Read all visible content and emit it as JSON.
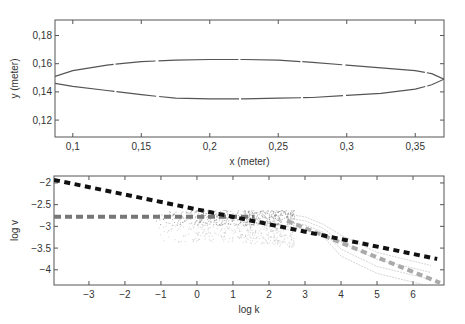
{
  "chart_data": [
    {
      "type": "line",
      "title": "",
      "xlabel": "x (meter)",
      "ylabel": "y (meter)",
      "xlim": [
        0.087,
        0.371
      ],
      "ylim": [
        0.108,
        0.191
      ],
      "xticks": [
        0.1,
        0.15,
        0.2,
        0.25,
        0.3,
        0.35
      ],
      "xtick_labels": [
        "0,1",
        "0,15",
        "0,2",
        "0,25",
        "0,3",
        "0,35"
      ],
      "yticks": [
        0.12,
        0.14,
        0.16,
        0.18
      ],
      "ytick_labels": [
        "0,12",
        "0,14",
        "0,16",
        "0,18"
      ],
      "grid": false,
      "legend": null,
      "series": [
        {
          "name": "upper contour",
          "color": "#555555",
          "x": [
            0.087,
            0.1,
            0.125,
            0.15,
            0.175,
            0.2,
            0.225,
            0.25,
            0.275,
            0.3,
            0.325,
            0.35,
            0.362,
            0.371
          ],
          "y": [
            0.151,
            0.155,
            0.159,
            0.1615,
            0.1625,
            0.163,
            0.163,
            0.1625,
            0.161,
            0.159,
            0.157,
            0.155,
            0.153,
            0.149
          ]
        },
        {
          "name": "lower contour",
          "color": "#555555",
          "x": [
            0.087,
            0.1,
            0.125,
            0.15,
            0.175,
            0.2,
            0.225,
            0.25,
            0.275,
            0.3,
            0.325,
            0.35,
            0.362,
            0.371
          ],
          "y": [
            0.146,
            0.144,
            0.141,
            0.138,
            0.1355,
            0.135,
            0.135,
            0.1355,
            0.136,
            0.1375,
            0.139,
            0.142,
            0.145,
            0.149
          ]
        }
      ]
    },
    {
      "type": "scatter",
      "title": "",
      "xlabel": "log k",
      "ylabel": "log v",
      "xlim": [
        -3.97,
        6.86
      ],
      "ylim": [
        -4.35,
        -1.84
      ],
      "xticks": [
        -3,
        -2,
        -1,
        0,
        1,
        2,
        3,
        4,
        5,
        6
      ],
      "xtick_labels": [
        "−3",
        "−2",
        "−1",
        "0",
        "1",
        "2",
        "3",
        "4",
        "5",
        "6"
      ],
      "yticks": [
        -2,
        -2.5,
        -3,
        -3.5,
        -4
      ],
      "ytick_labels": [
        "−2",
        "−2.5",
        "−3",
        "−3.5",
        "−4"
      ],
      "grid": false,
      "legend": null,
      "series": [
        {
          "name": "black dashed fit",
          "style": "dashed",
          "color": "#111111",
          "x": [
            -3.97,
            6.67
          ],
          "y": [
            -1.93,
            -3.75
          ]
        },
        {
          "name": "gray horizontal dashed",
          "style": "dashed",
          "color": "#777777",
          "x": [
            -3.97,
            1.6
          ],
          "y": [
            -2.78,
            -2.78
          ]
        },
        {
          "name": "light gray dashed fit",
          "style": "dashed",
          "color": "#aaaaaa",
          "x": [
            2.5,
            6.75
          ],
          "y": [
            -2.87,
            -4.3
          ]
        },
        {
          "name": "scatter cloud",
          "style": "points",
          "color": "#888888",
          "x_range": [
            -1.5,
            3.0
          ],
          "y_range": [
            -3.5,
            -2.6
          ],
          "note": "dense cluster around log k 0.5 to 2.6, log v -2.6 to -3.0"
        },
        {
          "name": "thin trailing curves",
          "style": "thin",
          "color": "#999999",
          "x": [
            2.5,
            3.0,
            3.5,
            4.0,
            5.0,
            6.5
          ],
          "y": [
            -2.72,
            -2.78,
            -2.95,
            -3.2,
            -3.6,
            -3.9
          ]
        }
      ]
    }
  ]
}
